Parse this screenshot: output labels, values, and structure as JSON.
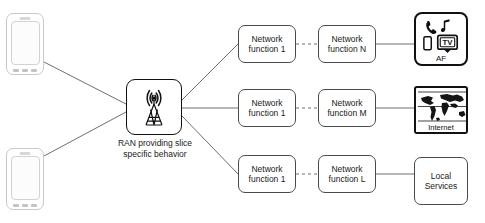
{
  "diagram": {
    "stroke_color": "#4a4a4a",
    "strong_stroke_color": "#111111",
    "background": "#ffffff"
  },
  "devices": [
    {
      "name": "smartphone-top",
      "label": ""
    },
    {
      "name": "smartphone-bottom",
      "label": ""
    }
  ],
  "ran": {
    "icon": "cell-tower-antenna-icon",
    "caption_line1": "RAN providing slice",
    "caption_line2": "specific behavior"
  },
  "chains": [
    {
      "id": "chain-top",
      "first": {
        "line1": "Network",
        "line2": "function 1"
      },
      "second": {
        "line1": "Network",
        "line2": "function N"
      },
      "connector": "dashed",
      "endpoint": "af"
    },
    {
      "id": "chain-middle",
      "first": {
        "line1": "Network",
        "line2": "function 1"
      },
      "second": {
        "line1": "Network",
        "line2": "function M"
      },
      "connector": "dashed",
      "endpoint": "internet"
    },
    {
      "id": "chain-bottom",
      "first": {
        "line1": "Network",
        "line2": "function 1"
      },
      "second": {
        "line1": "Network",
        "line2": "function L"
      },
      "connector": "dashed",
      "endpoint": "local-services"
    }
  ],
  "endpoints": {
    "af": {
      "label": "AF",
      "icons": [
        "telephone-handset-icon",
        "music-note-icon",
        "mobile-device-icon",
        "tv-icon"
      ],
      "tv_text": "TV"
    },
    "internet": {
      "label": "Internet",
      "icon": "world-map-icon"
    },
    "local_services": {
      "line1": "Local",
      "line2": "Services"
    }
  }
}
